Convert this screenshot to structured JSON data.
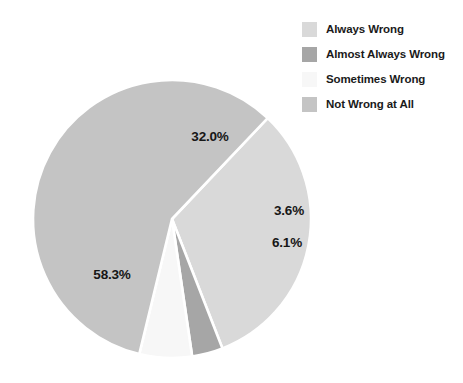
{
  "chart_data": {
    "type": "pie",
    "title": "",
    "subtitle": "",
    "xlabel": "",
    "ylabel": "",
    "grid": false,
    "legend_position": "top-right",
    "start_angle_deg": -46.5,
    "direction": "clockwise",
    "center": {
      "x": 172,
      "y": 219
    },
    "radius": 139,
    "categories": [
      "Always Wrong",
      "Almost Always Wrong",
      "Sometimes Wrong",
      "Not Wrong at All"
    ],
    "values": [
      32.0,
      3.6,
      6.1,
      58.3
    ],
    "value_labels": [
      "32.0%",
      "3.6%",
      "6.1%",
      "58.3%"
    ],
    "colors": [
      "#d9d9d9",
      "#a6a6a6",
      "#f7f7f7",
      "#c4c4c4"
    ],
    "slices": [
      {
        "label": "Always Wrong",
        "value": 32.0,
        "value_label": "32.0%",
        "color": "#d9d9d9",
        "label_x": 210,
        "label_y": 136
      },
      {
        "label": "Almost Always Wrong",
        "value": 3.6,
        "value_label": "3.6%",
        "color": "#a6a6a6",
        "label_x": 289,
        "label_y": 210
      },
      {
        "label": "Sometimes Wrong",
        "value": 6.1,
        "value_label": "6.1%",
        "color": "#f7f7f7",
        "label_x": 287,
        "label_y": 242
      },
      {
        "label": "Not Wrong at All",
        "value": 58.3,
        "value_label": "58.3%",
        "color": "#c4c4c4",
        "label_x": 112,
        "label_y": 274
      }
    ]
  },
  "legend": {
    "items": [
      {
        "label": "Always Wrong",
        "color": "#d9d9d9"
      },
      {
        "label": "Almost Always Wrong",
        "color": "#a6a6a6"
      },
      {
        "label": "Sometimes Wrong",
        "color": "#f7f7f7"
      },
      {
        "label": "Not Wrong at All",
        "color": "#c4c4c4"
      }
    ]
  },
  "canvas": {
    "background": "#ffffff",
    "width": 463,
    "height": 383
  }
}
